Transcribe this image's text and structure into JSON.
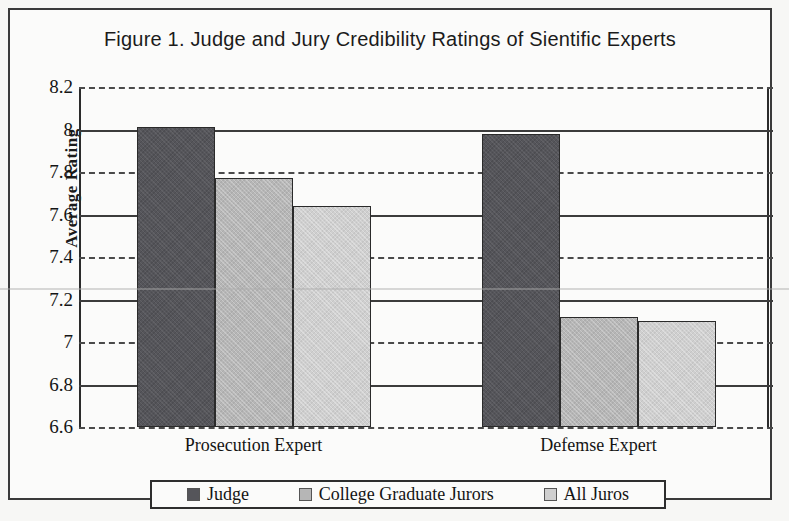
{
  "figure": {
    "title": "Figure  1.  Judge and Jury Credibility Ratings of Sientific Experts"
  },
  "chart_data": {
    "type": "bar",
    "title": "Figure  1.  Judge and Jury Credibility Ratings of Sientific Experts",
    "xlabel": "",
    "ylabel": "Average Rating",
    "categories": [
      "Prosecution Expert",
      "Defemse Expert"
    ],
    "series": [
      {
        "name": "Judge",
        "values": [
          8.01,
          7.98
        ],
        "color": "#55555a"
      },
      {
        "name": "College Graduate Jurors",
        "values": [
          7.77,
          7.12
        ],
        "color": "#b6b6b6"
      },
      {
        "name": "All Juros",
        "values": [
          7.64,
          7.1
        ],
        "color": "#cfcfcf"
      }
    ],
    "ylim": [
      6.6,
      8.2
    ],
    "ytick_step": 0.2,
    "ytick_labels": [
      "8.2",
      "8",
      "7.8",
      "7.6",
      "7.4",
      "7.2",
      "7",
      "6.8",
      "6.6"
    ],
    "ytick_values": [
      8.2,
      8.0,
      7.8,
      7.6,
      7.4,
      7.2,
      7.0,
      6.8,
      6.6
    ],
    "grid": true,
    "legend_position": "bottom"
  },
  "axis": {
    "y_title": "Average Rating"
  },
  "legend": {
    "items": [
      {
        "label": "Judge"
      },
      {
        "label": "College Graduate Jurors"
      },
      {
        "label": "All Juros"
      }
    ]
  }
}
